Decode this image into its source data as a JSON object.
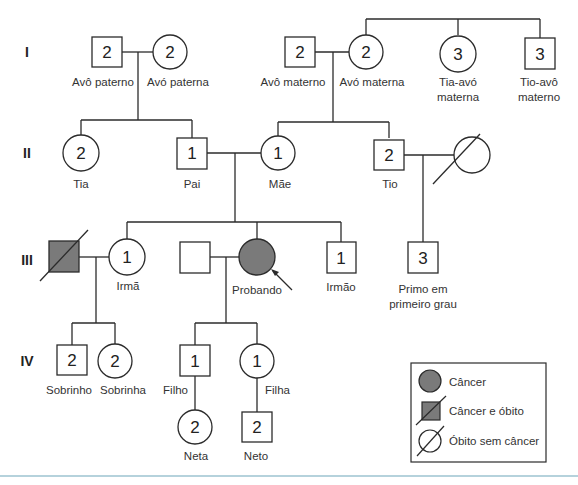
{
  "generations": [
    "I",
    "II",
    "III",
    "IV"
  ],
  "individuals": {
    "avo_paterno": {
      "number": "2",
      "label": "Avô paterno",
      "sex": "male"
    },
    "avo_paterna": {
      "number": "2",
      "label": "Avó paterna",
      "sex": "female"
    },
    "avo_materno": {
      "number": "2",
      "label": "Avô materno",
      "sex": "male"
    },
    "avo_materna": {
      "number": "2",
      "label": "Avó materna",
      "sex": "female"
    },
    "tia_avo": {
      "number": "3",
      "label_line1": "Tia-avó",
      "label_line2": "materna",
      "sex": "female"
    },
    "tio_avo": {
      "number": "3",
      "label_line1": "Tio-avô",
      "label_line2": "materno",
      "sex": "male"
    },
    "tia": {
      "number": "2",
      "label": "Tia",
      "sex": "female"
    },
    "pai": {
      "number": "1",
      "label": "Pai",
      "sex": "male"
    },
    "mae": {
      "number": "1",
      "label": "Mãe",
      "sex": "female"
    },
    "tio": {
      "number": "2",
      "label": "Tio",
      "sex": "male"
    },
    "tio_esposa": {
      "status": "deceased_no_cancer",
      "sex": "female"
    },
    "cunhado": {
      "status": "cancer_deceased",
      "sex": "male"
    },
    "irma": {
      "number": "1",
      "label": "Irmã",
      "sex": "female"
    },
    "conjuge_probando": {
      "sex": "male"
    },
    "probando": {
      "label": "Probando",
      "sex": "female",
      "status": "cancer"
    },
    "irmao": {
      "number": "1",
      "label": "Irmão",
      "sex": "male"
    },
    "primo": {
      "number": "3",
      "label_line1": "Primo em",
      "label_line2": "primeiro grau",
      "sex": "male"
    },
    "sobrinho": {
      "number": "2",
      "label": "Sobrinho",
      "sex": "male"
    },
    "sobrinha": {
      "number": "2",
      "label": "Sobrinha",
      "sex": "female"
    },
    "filho": {
      "number": "1",
      "label": "Filho",
      "sex": "male"
    },
    "filha": {
      "number": "1",
      "label": "Filha",
      "sex": "female"
    },
    "neta": {
      "number": "2",
      "label": "Neta",
      "sex": "female"
    },
    "neto": {
      "number": "2",
      "label": "Neto",
      "sex": "male"
    }
  },
  "legend": {
    "items": [
      {
        "symbol": "filled-circle",
        "label": "Câncer"
      },
      {
        "symbol": "filled-square-slash",
        "label": "Câncer e óbito"
      },
      {
        "symbol": "empty-circle-slash",
        "label": "Óbito sem câncer"
      }
    ]
  },
  "colors": {
    "affected_fill": "#7a7a7a",
    "line": "#2b2b2b",
    "bottom_rule": "#9cc3d1"
  }
}
